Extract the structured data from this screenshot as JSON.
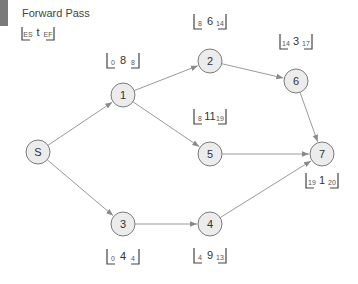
{
  "title": "Forward Pass",
  "legend": {
    "es": "ES",
    "t": "t",
    "ef": "EF"
  },
  "colors": {
    "accent_bar": "#7a7a7a",
    "node_fill": "#ececec",
    "node_stroke": "#7a7a7a",
    "edge": "#9a9a9a"
  },
  "nodes": [
    {
      "id": "S",
      "label": "S"
    },
    {
      "id": "1",
      "label": "1",
      "es": "0",
      "t": "8",
      "ef": "8"
    },
    {
      "id": "2",
      "label": "2",
      "es": "8",
      "t": "6",
      "ef": "14"
    },
    {
      "id": "3",
      "label": "3",
      "es": "0",
      "t": "4",
      "ef": "4"
    },
    {
      "id": "4",
      "label": "4",
      "es": "4",
      "t": "9",
      "ef": "13"
    },
    {
      "id": "5",
      "label": "5",
      "es": "8",
      "t": "11",
      "ef": "19"
    },
    {
      "id": "6",
      "label": "6",
      "es": "14",
      "t": "3",
      "ef": "17"
    },
    {
      "id": "7",
      "label": "7",
      "es": "19",
      "t": "1",
      "ef": "20"
    }
  ],
  "edges": [
    {
      "from": "S",
      "to": "1"
    },
    {
      "from": "S",
      "to": "3"
    },
    {
      "from": "1",
      "to": "2"
    },
    {
      "from": "1",
      "to": "5"
    },
    {
      "from": "2",
      "to": "6"
    },
    {
      "from": "6",
      "to": "7"
    },
    {
      "from": "5",
      "to": "7"
    },
    {
      "from": "3",
      "to": "4"
    },
    {
      "from": "4",
      "to": "7"
    }
  ]
}
